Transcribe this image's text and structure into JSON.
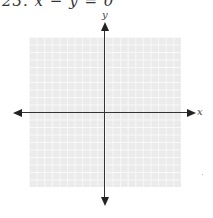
{
  "problem": {
    "text": "23. x − y = 0"
  },
  "graph": {
    "x_axis_label": "x",
    "y_axis_label": "y",
    "grid": {
      "columns": 20,
      "rows": 20,
      "color": "#ebebeb",
      "line_color": "#f8f8f8"
    },
    "axis_color": "#333333"
  }
}
